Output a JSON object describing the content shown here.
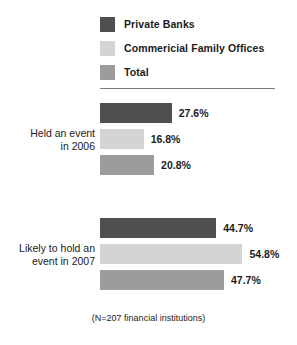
{
  "chart_data": {
    "type": "bar",
    "orientation": "horizontal",
    "title": "",
    "xlabel": "",
    "ylabel": "",
    "grid": false,
    "legend_position": "top",
    "footnote": "(N=207 financial institutions)",
    "categories": [
      "Held an event\nin 2006",
      "Likely to hold an\nevent in 2007"
    ],
    "series": [
      {
        "name": "Private Banks",
        "color": "#4f4f4f",
        "values": [
          27.6,
          54.8
        ],
        "labels": [
          "27.6%",
          "44.7%"
        ]
      },
      {
        "name": "Commericial Family Offices",
        "color": "#d4d4d4",
        "values": [
          16.8,
          54.8
        ],
        "labels": [
          "16.8%",
          "54.8%"
        ]
      },
      {
        "name": "Total",
        "color": "#9c9c9c",
        "values": [
          20.8,
          47.7
        ],
        "labels": [
          "20.8%",
          "47.7%"
        ]
      }
    ],
    "groups": [
      {
        "category": "Held an event\nin 2006",
        "bars": [
          {
            "series": "Private Banks",
            "value": 27.6,
            "label": "27.6%",
            "color": "#4f4f4f"
          },
          {
            "series": "Commericial Family Offices",
            "value": 16.8,
            "label": "16.8%",
            "color": "#d4d4d4"
          },
          {
            "series": "Total",
            "value": 20.8,
            "label": "20.8%",
            "color": "#9c9c9c"
          }
        ]
      },
      {
        "category": "Likely to hold an\nevent in 2007",
        "bars": [
          {
            "series": "Private Banks",
            "value": 44.7,
            "label": "44.7%",
            "color": "#4f4f4f"
          },
          {
            "series": "Commericial Family Offices",
            "value": 54.8,
            "label": "54.8%",
            "color": "#d4d4d4"
          },
          {
            "series": "Total",
            "value": 47.7,
            "label": "47.7%",
            "color": "#9c9c9c"
          }
        ]
      }
    ],
    "xlim": [
      0,
      60
    ],
    "px_per_unit": 2.6
  },
  "legend": {
    "items": [
      {
        "label": "Private Banks",
        "color": "#4f4f4f"
      },
      {
        "label": "Commericial Family Offices",
        "color": "#d4d4d4"
      },
      {
        "label": "Total",
        "color": "#9c9c9c"
      }
    ]
  },
  "groups": {
    "g1": {
      "label": "Held an event\nin 2006",
      "b0": "27.6%",
      "b1": "16.8%",
      "b2": "20.8%"
    },
    "g2": {
      "label": "Likely to hold an\nevent in 2007",
      "b0": "44.7%",
      "b1": "54.8%",
      "b2": "47.7%"
    }
  },
  "footnote": "(N=207 financial institutions)",
  "colors": {
    "private_banks": "#4f4f4f",
    "family_offices": "#d4d4d4",
    "total": "#9c9c9c",
    "rule": "#7d7d7d",
    "text": "#1b1b1b"
  }
}
